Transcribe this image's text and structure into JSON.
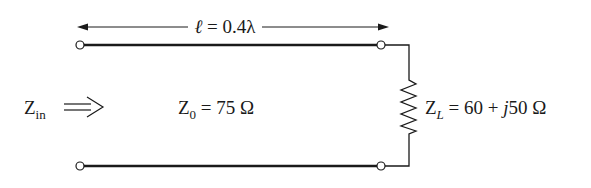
{
  "diagram": {
    "type": "transmission-line-circuit",
    "length_label": {
      "symbol": "ℓ",
      "equals": " = ",
      "value": "0.4λ"
    },
    "input": {
      "symbol": "Z",
      "subscript": "in"
    },
    "line": {
      "symbol": "Z",
      "subscript": "0",
      "value": " = 75 Ω"
    },
    "load": {
      "symbol": "Z",
      "subscript": "L",
      "value": " = 60 + ",
      "imag_unit": "j",
      "imag_value": "50 Ω"
    },
    "colors": {
      "line": "#1a1a1a",
      "background": "#ffffff"
    }
  }
}
